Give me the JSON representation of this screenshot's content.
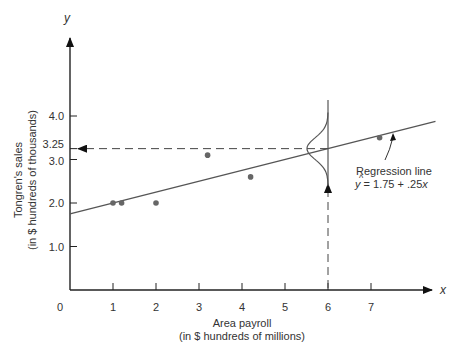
{
  "chart_data": {
    "type": "scatter",
    "title": "",
    "xlabel_line1": "Area payroll",
    "xlabel_line2": "(in $ hundreds of millions)",
    "ylabel_line1": "Tongren's sales",
    "ylabel_line2": "(in $ hundreds of thousands)",
    "x_axis_symbol": "x",
    "y_axis_symbol": "y",
    "origin_label": "0",
    "x_ticks": [
      "1",
      "2",
      "3",
      "4",
      "5",
      "6",
      "7"
    ],
    "y_ticks": [
      "1.0",
      "2.0",
      "3.0",
      "3.25",
      "4.0"
    ],
    "xlim": [
      0,
      8.5
    ],
    "ylim": [
      0,
      5.5
    ],
    "grid": false,
    "series": [
      {
        "name": "Observations",
        "points": [
          {
            "x": 1.0,
            "y": 2.0
          },
          {
            "x": 1.2,
            "y": 2.0
          },
          {
            "x": 2.0,
            "y": 2.0
          },
          {
            "x": 3.2,
            "y": 3.1
          },
          {
            "x": 4.2,
            "y": 2.6
          },
          {
            "x": 7.2,
            "y": 3.5
          }
        ]
      },
      {
        "name": "Regression line",
        "type": "line",
        "intercept": 1.75,
        "slope": 0.25
      }
    ],
    "annotations": [
      {
        "text": "Regression line",
        "target": "regression-line"
      },
      {
        "text": "ŷ = 1.75 + .25x",
        "target": "regression-equation"
      },
      {
        "text": "Prediction at x = 6 gives y = 3.25",
        "type": "dashed-arrows"
      },
      {
        "text": "Normal distribution of y around regression line at x = 6",
        "type": "bell-curve"
      }
    ]
  },
  "labels": {
    "regression_line": "Regression line",
    "eq_y": "y",
    "eq_rest": " = 1.75 + .25",
    "eq_x": "x"
  }
}
